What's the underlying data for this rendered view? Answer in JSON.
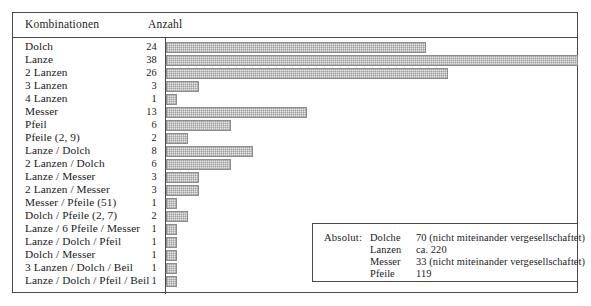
{
  "figure": {
    "header": {
      "col_labels": "Kombinationen",
      "col_counts": "Anzahl"
    }
  },
  "chart_data": {
    "type": "bar",
    "orientation": "horizontal",
    "title": "",
    "xlabel": "Anzahl",
    "ylabel": "Kombinationen",
    "xlim": [
      0,
      38
    ],
    "grid": false,
    "legend_position": "bottom-right",
    "categories": [
      "Dolch",
      "Lanze",
      "2 Lanzen",
      "3 Lanzen",
      "4 Lanzen",
      "Messer",
      "Pfeil",
      "Pfeile (2, 9)",
      "Lanze / Dolch",
      "2 Lanzen / Dolch",
      "Lanze / Messer",
      "2 Lanzen / Messer",
      "Messer / Pfeile (51)",
      "Dolch / Pfeile (2, 7)",
      "Lanze / 6 Pfeile / Messer",
      "Lanze / Dolch / Pfeil",
      "Dolch / Messer",
      "3 Lanzen / Dolch / Beil",
      "Lanze / Dolch / Pfeil / Beil"
    ],
    "values": [
      24,
      38,
      26,
      3,
      1,
      13,
      6,
      2,
      8,
      6,
      3,
      3,
      1,
      2,
      1,
      1,
      1,
      1,
      1
    ]
  },
  "legend": {
    "title": "Absolut:",
    "rows": [
      {
        "name": "Dolche",
        "value": "70 (nicht miteinander vergesellschaftet)"
      },
      {
        "name": "Lanzen",
        "value": "ca. 220"
      },
      {
        "name": "Messer",
        "value": "33 (nicht miteinander vergesellschaftet)"
      },
      {
        "name": "Pfeile",
        "value": "119"
      }
    ]
  },
  "style": {
    "bar_fill": "#e6e6e6",
    "bar_border": "#8c8c8c",
    "frame": "#4a4a4a",
    "text": "#1a1a1a"
  }
}
